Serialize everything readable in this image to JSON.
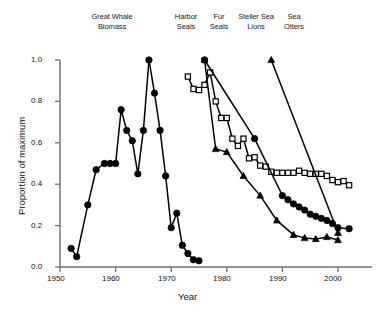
{
  "chart_data": {
    "type": "line",
    "title": "",
    "xlabel": "Year",
    "ylabel": "Proportion of maximum",
    "xlim": [
      1950,
      2005
    ],
    "ylim": [
      0,
      1
    ],
    "xticks": [
      1950,
      1960,
      1970,
      1980,
      1990,
      2000
    ],
    "xtick_labels": [
      "1950",
      "1960",
      "1970",
      "1980",
      "1990",
      "2000"
    ],
    "yticks": [
      0.0,
      0.2,
      0.4,
      0.6,
      0.8,
      1.0
    ],
    "ytick_labels": [
      "0.0",
      "0.2",
      "0.4",
      "0.6",
      "0.8",
      "1.0"
    ],
    "grid": false,
    "legend": "top-inline-labels",
    "annotations": [
      {
        "text": "Great Whale\nBiomass",
        "x_px": 112,
        "y_px": 12
      },
      {
        "text": "Harbor\nSeals",
        "x_px": 186,
        "y_px": 12
      },
      {
        "text": "Fur\nSeals",
        "x_px": 218,
        "y_px": 12
      },
      {
        "text": "Steller Sea\nLions",
        "x_px": 253,
        "y_px": 12
      },
      {
        "text": "Sea\nOtters",
        "x_px": 293,
        "y_px": 12
      }
    ],
    "series": [
      {
        "name": "Great Whale Biomass",
        "marker": "filled-circle",
        "color": "#000000",
        "x": [
          1952,
          1953,
          1955,
          1956.5,
          1958,
          1959,
          1960,
          1961,
          1962,
          1963,
          1964,
          1965,
          1966,
          1967,
          1968,
          1969,
          1970,
          1971,
          1972,
          1973,
          1974,
          1975
        ],
        "y": [
          0.09,
          0.05,
          0.3,
          0.47,
          0.5,
          0.5,
          0.5,
          0.76,
          0.66,
          0.61,
          0.45,
          0.66,
          1.0,
          0.84,
          0.66,
          0.44,
          0.19,
          0.26,
          0.105,
          0.065,
          0.035,
          0.03
        ]
      },
      {
        "name": "Harbor Seals",
        "marker": "open-square",
        "color": "#000000",
        "x": [
          1973,
          1974,
          1975,
          1976,
          1977,
          1978,
          1979,
          1980,
          1981,
          1982,
          1983,
          1984,
          1985,
          1986,
          1987,
          1988,
          1989,
          1990,
          1991,
          1992,
          1993,
          1994,
          1995,
          1996,
          1997,
          1998,
          1999,
          2000,
          2001,
          2002
        ],
        "y": [
          0.92,
          0.86,
          0.855,
          0.88,
          0.94,
          0.8,
          0.72,
          0.72,
          0.62,
          0.585,
          0.62,
          0.525,
          0.53,
          0.49,
          0.485,
          0.46,
          0.455,
          0.455,
          0.455,
          0.455,
          0.465,
          0.455,
          0.45,
          0.45,
          0.45,
          0.44,
          0.42,
          0.41,
          0.415,
          0.395
        ]
      },
      {
        "name": "Fur Seals",
        "marker": "filled-triangle",
        "color": "#000000",
        "x": [
          1976,
          1978,
          1980,
          1983,
          1986,
          1989,
          1992,
          1994,
          1996,
          1998,
          2000
        ],
        "y": [
          1.0,
          0.57,
          0.555,
          0.44,
          0.345,
          0.225,
          0.155,
          0.14,
          0.135,
          0.145,
          0.13
        ]
      },
      {
        "name": "Steller Sea Lions",
        "marker": "filled-circle",
        "color": "#000000",
        "x": [
          1976,
          1985,
          1990,
          1991,
          1992,
          1993,
          1994,
          1995,
          1996,
          1997,
          1998,
          1999,
          2000,
          2002
        ],
        "y": [
          1.0,
          0.62,
          0.345,
          0.325,
          0.305,
          0.29,
          0.275,
          0.255,
          0.245,
          0.235,
          0.225,
          0.21,
          0.19,
          0.185
        ]
      },
      {
        "name": "Sea Otters",
        "marker": "filled-triangle",
        "color": "#000000",
        "x": [
          1988,
          2000
        ],
        "y": [
          1.0,
          0.165
        ]
      }
    ]
  }
}
